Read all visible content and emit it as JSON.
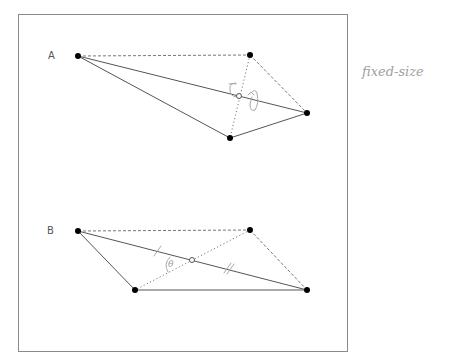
{
  "frame": {
    "x": 18,
    "y": 14,
    "width": 329,
    "height": 337,
    "stroke": "#8a8a8a"
  },
  "annotation": {
    "text": "fixed-size",
    "x": 362,
    "y": 76
  },
  "figures": [
    {
      "label": "A",
      "label_pos": [
        48,
        59
      ],
      "vertices": {
        "p1": [
          78,
          56
        ],
        "p2": [
          250,
          55
        ],
        "p3": [
          307,
          113
        ],
        "p4": [
          230,
          138
        ]
      },
      "center": [
        239,
        96
      ],
      "solid_edges": [
        [
          "p1",
          "p3"
        ],
        [
          "p1",
          "p4"
        ],
        [
          "p4",
          "p3"
        ]
      ],
      "dashed_edges": [
        [
          "p1",
          "p2"
        ],
        [
          "p2",
          "p3"
        ]
      ],
      "dotted_edges": [
        [
          "p2",
          "p4"
        ]
      ],
      "rotation_marks": true
    },
    {
      "label": "B",
      "label_pos": [
        47,
        234
      ],
      "vertices": {
        "p1": [
          78,
          231
        ],
        "p2": [
          250,
          230
        ],
        "p3": [
          307,
          290
        ],
        "p4": [
          135,
          290
        ]
      },
      "center": [
        192,
        260
      ],
      "solid_edges": [
        [
          "p1",
          "p3"
        ],
        [
          "p1",
          "p4"
        ],
        [
          "p4",
          "p3"
        ]
      ],
      "dashed_edges": [
        [
          "p1",
          "p2"
        ],
        [
          "p2",
          "p3"
        ]
      ],
      "dotted_edges": [
        [
          "p2",
          "p4"
        ]
      ],
      "angle_label": "θ",
      "tick_marks": true
    }
  ],
  "colors": {
    "vertex": "#000000",
    "line": "#555555",
    "handwriting": "#a8a8a8"
  }
}
